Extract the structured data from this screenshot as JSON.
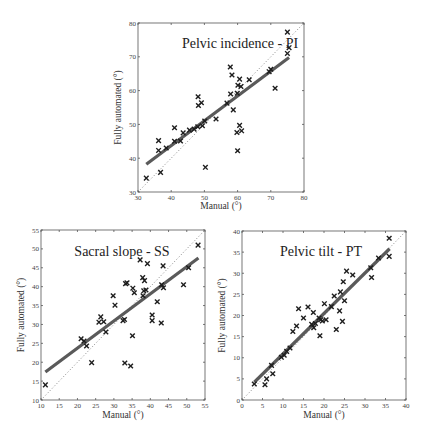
{
  "chart_data": [
    {
      "type": "scatter",
      "title": "Pelvic incidence - PI",
      "xlabel": "Manual (°)",
      "ylabel": "Fully automated (°)",
      "xlim": [
        30,
        80
      ],
      "ylim": [
        30,
        80
      ],
      "xticks": [
        30,
        40,
        50,
        60,
        70,
        80
      ],
      "yticks": [
        30,
        40,
        50,
        60,
        70,
        80
      ],
      "grid": false,
      "identity_line": true,
      "fit_line": {
        "x": [
          32.5,
          75.5
        ],
        "y": [
          38.2,
          69.8
        ]
      },
      "points": [
        [
          32.5,
          34.1
        ],
        [
          36.2,
          45.2
        ],
        [
          36.2,
          42.3
        ],
        [
          36.8,
          35.8
        ],
        [
          38.5,
          43.0
        ],
        [
          41.0,
          49.0
        ],
        [
          41.0,
          45.0
        ],
        [
          42.8,
          45.1
        ],
        [
          43.6,
          47.5
        ],
        [
          45.5,
          48.3
        ],
        [
          46.9,
          48.6
        ],
        [
          48.0,
          49.3
        ],
        [
          48.1,
          58.2
        ],
        [
          48.2,
          55.6
        ],
        [
          49.1,
          56.4
        ],
        [
          49.4,
          49.6
        ],
        [
          50.1,
          51.0
        ],
        [
          50.3,
          37.3
        ],
        [
          53.5,
          51.6
        ],
        [
          56.8,
          56.3
        ],
        [
          57.8,
          67.0
        ],
        [
          57.9,
          59.0
        ],
        [
          58.3,
          64.6
        ],
        [
          58.7,
          54.3
        ],
        [
          59.8,
          47.6
        ],
        [
          59.9,
          59.2
        ],
        [
          60.1,
          61.6
        ],
        [
          60.0,
          42.2
        ],
        [
          60.6,
          63.4
        ],
        [
          60.6,
          49.7
        ],
        [
          61.0,
          61.2
        ],
        [
          61.2,
          48.1
        ],
        [
          63.5,
          63.2
        ],
        [
          69.5,
          65.6
        ],
        [
          70.0,
          66.3
        ],
        [
          71.3,
          60.7
        ],
        [
          75.0,
          77.3
        ],
        [
          75.0,
          71.0
        ],
        [
          75.5,
          72.7
        ]
      ]
    },
    {
      "type": "scatter",
      "title": "Sacral slope - SS",
      "xlabel": "Manual (°)",
      "ylabel": "Fully automated (°)",
      "xlim": [
        10,
        55
      ],
      "ylim": [
        10,
        55
      ],
      "xticks": [
        10,
        15,
        20,
        25,
        30,
        35,
        40,
        45,
        50,
        55
      ],
      "yticks": [
        10,
        15,
        20,
        25,
        30,
        35,
        40,
        45,
        50,
        55
      ],
      "grid": false,
      "identity_line": true,
      "fit_line": {
        "x": [
          11.2,
          53.2
        ],
        "y": [
          17.4,
          47.6
        ]
      },
      "points": [
        [
          11.2,
          14.0
        ],
        [
          21.0,
          26.2
        ],
        [
          21.8,
          25.6
        ],
        [
          22.5,
          24.3
        ],
        [
          23.9,
          19.9
        ],
        [
          25.9,
          30.6
        ],
        [
          26.4,
          32.0
        ],
        [
          27.2,
          30.7
        ],
        [
          27.8,
          28.0
        ],
        [
          29.8,
          37.6
        ],
        [
          30.3,
          35.1
        ],
        [
          32.5,
          31.0
        ],
        [
          32.9,
          31.3
        ],
        [
          33.0,
          19.8
        ],
        [
          33.2,
          40.8
        ],
        [
          33.6,
          41.0
        ],
        [
          34.6,
          19.0
        ],
        [
          35.1,
          27.0
        ],
        [
          35.2,
          39.6
        ],
        [
          35.6,
          38.4
        ],
        [
          37.2,
          47.1
        ],
        [
          37.9,
          42.4
        ],
        [
          38.2,
          38.9
        ],
        [
          38.0,
          37.6
        ],
        [
          38.4,
          41.6
        ],
        [
          38.8,
          39.1
        ],
        [
          39.2,
          46.1
        ],
        [
          40.5,
          32.5
        ],
        [
          40.5,
          31.0
        ],
        [
          41.9,
          36.0
        ],
        [
          43.0,
          30.4
        ],
        [
          43.1,
          40.5
        ],
        [
          43.5,
          45.5
        ],
        [
          43.6,
          39.7
        ],
        [
          49.1,
          40.5
        ],
        [
          50.5,
          45.0
        ],
        [
          53.1,
          51.0
        ]
      ]
    },
    {
      "type": "scatter",
      "title": "Pelvic tilt - PT",
      "xlabel": "Manual (°)",
      "ylabel": "Fully automated (°)",
      "xlim": [
        0,
        40
      ],
      "ylim": [
        0,
        40
      ],
      "xticks": [
        0,
        5,
        10,
        15,
        20,
        25,
        30,
        35,
        40
      ],
      "yticks": [
        0,
        5,
        10,
        15,
        20,
        25,
        30,
        35,
        40
      ],
      "grid": false,
      "identity_line": true,
      "fit_line": {
        "x": [
          3.0,
          36.0
        ],
        "y": [
          4.2,
          35.8
        ]
      },
      "points": [
        [
          3.0,
          3.8
        ],
        [
          5.6,
          3.6
        ],
        [
          6.0,
          5.0
        ],
        [
          7.2,
          8.2
        ],
        [
          7.5,
          6.2
        ],
        [
          9.6,
          10.1
        ],
        [
          10.3,
          10.6
        ],
        [
          10.9,
          11.5
        ],
        [
          11.7,
          12.3
        ],
        [
          12.4,
          16.2
        ],
        [
          13.3,
          17.5
        ],
        [
          13.8,
          21.6
        ],
        [
          15.0,
          19.4
        ],
        [
          16.1,
          22.0
        ],
        [
          17.0,
          17.9
        ],
        [
          17.4,
          20.7
        ],
        [
          17.5,
          17.1
        ],
        [
          17.9,
          18.1
        ],
        [
          18.8,
          19.4
        ],
        [
          19.0,
          15.2
        ],
        [
          19.2,
          19.0
        ],
        [
          19.6,
          18.7
        ],
        [
          20.1,
          22.8
        ],
        [
          20.5,
          19.0
        ],
        [
          21.8,
          22.1
        ],
        [
          22.5,
          24.6
        ],
        [
          23.0,
          16.7
        ],
        [
          23.8,
          21.1
        ],
        [
          24.0,
          25.6
        ],
        [
          24.5,
          18.6
        ],
        [
          24.7,
          28.0
        ],
        [
          25.0,
          23.5
        ],
        [
          25.5,
          30.5
        ],
        [
          27.0,
          29.6
        ],
        [
          31.4,
          31.3
        ],
        [
          31.6,
          29.0
        ],
        [
          33.3,
          33.6
        ],
        [
          35.9,
          38.3
        ],
        [
          35.9,
          34.0
        ]
      ]
    }
  ],
  "layout": {
    "panels": [
      {
        "id": "pi",
        "x0": 138,
        "x1": 304,
        "y0": 192,
        "y1": 23,
        "title_x": 240,
        "title_y": 48,
        "ylabel_x": 121,
        "xlabel_y": 209
      },
      {
        "id": "ss",
        "x0": 41,
        "x1": 205,
        "y0": 400,
        "y1": 230,
        "title_x": 122,
        "title_y": 256,
        "ylabel_x": 24,
        "xlabel_y": 418
      },
      {
        "id": "pt",
        "x0": 242,
        "x1": 406,
        "y0": 400,
        "y1": 231,
        "title_x": 321,
        "title_y": 256,
        "ylabel_x": 225,
        "xlabel_y": 418
      }
    ]
  }
}
